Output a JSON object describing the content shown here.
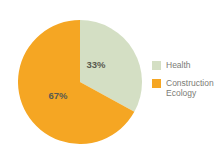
{
  "chart_data": {
    "type": "pie",
    "title": "",
    "categories": [
      "Health",
      "Construction Ecology"
    ],
    "values": [
      33,
      67
    ],
    "value_unit": "%",
    "data_labels": [
      "33%",
      "67%"
    ],
    "colors": [
      "#d4dfc4",
      "#f5a623"
    ],
    "legend_position": "right",
    "grid": false,
    "start_angle_deg": 0,
    "direction": "clockwise"
  },
  "pie": {
    "slices": [
      {
        "name": "Health",
        "label": "33%",
        "value": 33,
        "color": "#d4dfc4",
        "label_x": 78,
        "label_y": 48
      },
      {
        "name": "Construction Ecology",
        "label": "67%",
        "value": 67,
        "color": "#f5a623",
        "label_x": 40,
        "label_y": 79
      }
    ]
  },
  "legend": {
    "items": [
      {
        "label": "Health",
        "color": "#d4dfc4"
      },
      {
        "label": "Construction\nEcology",
        "color": "#f5a623"
      }
    ]
  }
}
